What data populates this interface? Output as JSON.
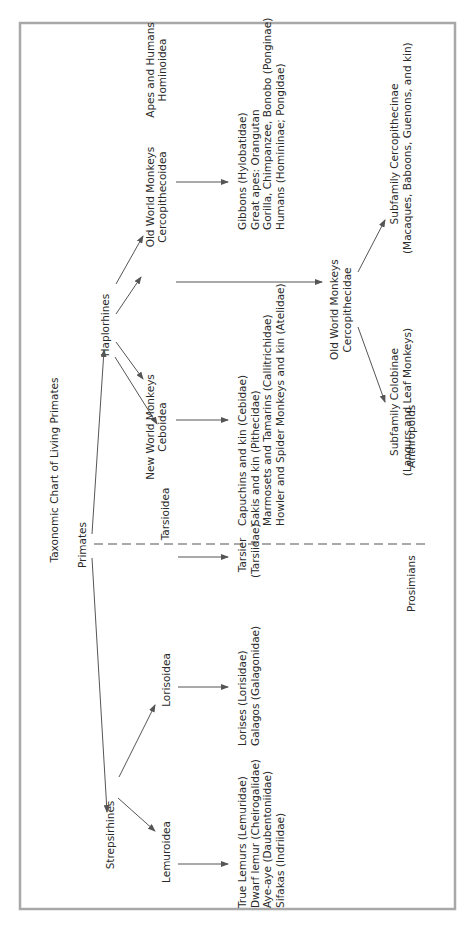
{
  "diagram": {
    "title": "Taxonomic Chart of Living Primates",
    "colors": {
      "frame": "#a8a8a8",
      "line": "#555555",
      "text": "#2a2a2a"
    },
    "root": {
      "label": "Primates"
    },
    "suborders": {
      "strepsirhines": {
        "label": "Strepsirhines"
      },
      "haplorhines": {
        "label": "Haplorhines"
      }
    },
    "superfamilies": {
      "lemuroidea": {
        "label": "Lemuroidea"
      },
      "lorisoidea": {
        "label": "Lorisoidea"
      },
      "tarsioidea": {
        "label": "Tarsioidea"
      },
      "ceboidea": {
        "line1": "New World Monkeys",
        "line2": "Ceboidea"
      },
      "cercopithecoidea": {
        "line1": "Old World Monkeys",
        "line2": "Cercopithecoidea"
      },
      "hominoidea": {
        "line1": "Apes and Humans",
        "line2": "Hominoidea"
      }
    },
    "families": {
      "lemuroidea": [
        "True Lemurs (Lemuridae)",
        "Dwarf lemur (Cheirogalidae)",
        "Aye-aye (Daubentoniidae)",
        "Sifakas (Indriidae)"
      ],
      "lorisoidea": [
        "Lorises (Lorisidae)",
        "Galagos (Galagonidae)"
      ],
      "tarsioidea": [
        "Tarsier",
        "(Tarsiidae)"
      ],
      "ceboidea": [
        "Capuchins and kin (Cebidae)",
        "Sakis and kin (Pithecidae)",
        "Marmosets and Tamarins (Callitrichidae)",
        "Howler and Spider Monkeys and kin (Atelidae)"
      ],
      "hominoidea": [
        "Gibbons (Hylobatidae)",
        "Great apes: Orangutan",
        "Gorilla, Chimpanzee, Bonobo (Ponginae)",
        "Humans (Homininae; Pongidae)"
      ]
    },
    "cercopithecidae": {
      "line1": "Old World Monkeys",
      "line2": "Cercopithecidae"
    },
    "subfamilies": {
      "colobinae": {
        "line1": "Subfamily Colobinae",
        "line2": "(Langurs and Leaf Monkeys)"
      },
      "cercopithecinae": {
        "line1": "Subfamily Cercopithecinae",
        "line2": "(Macaques, Baboons, Guenons, and kin)"
      }
    },
    "groups": {
      "prosimians": "Prosimians",
      "anthropoids": "Anthropoids"
    }
  }
}
